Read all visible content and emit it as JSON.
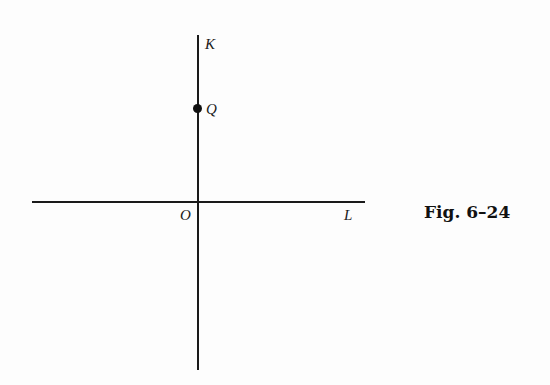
{
  "figure": {
    "caption": "Fig. 6–24",
    "axes": {
      "vertical_label": "K",
      "horizontal_label": "L",
      "origin_label": "O"
    },
    "points": [
      {
        "label": "Q",
        "position": "on K-axis above origin"
      }
    ]
  }
}
